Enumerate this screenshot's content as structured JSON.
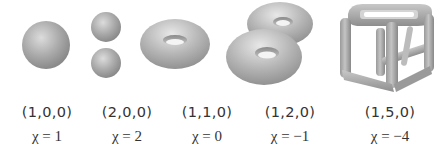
{
  "colors": {
    "surface": "#a8a8a8",
    "highlight": "#e6e6e6",
    "shadow": "#7a7a7a",
    "text": "#333333"
  },
  "shapes": [
    {
      "name": "sphere",
      "tuple": "(1,0,0)",
      "chi_symbol": "χ",
      "chi_text": "= 1"
    },
    {
      "name": "two-spheres",
      "tuple": "(2,0,0)",
      "chi_symbol": "χ",
      "chi_text": "= 2"
    },
    {
      "name": "torus",
      "tuple": "(1,1,0)",
      "chi_symbol": "χ",
      "chi_text": "= 0"
    },
    {
      "name": "double-torus",
      "tuple": "(1,2,0)",
      "chi_symbol": "χ",
      "chi_text": "= −1"
    },
    {
      "name": "cube-frame",
      "tuple": "(1,5,0)",
      "chi_symbol": "χ",
      "chi_text": "= −4"
    }
  ]
}
